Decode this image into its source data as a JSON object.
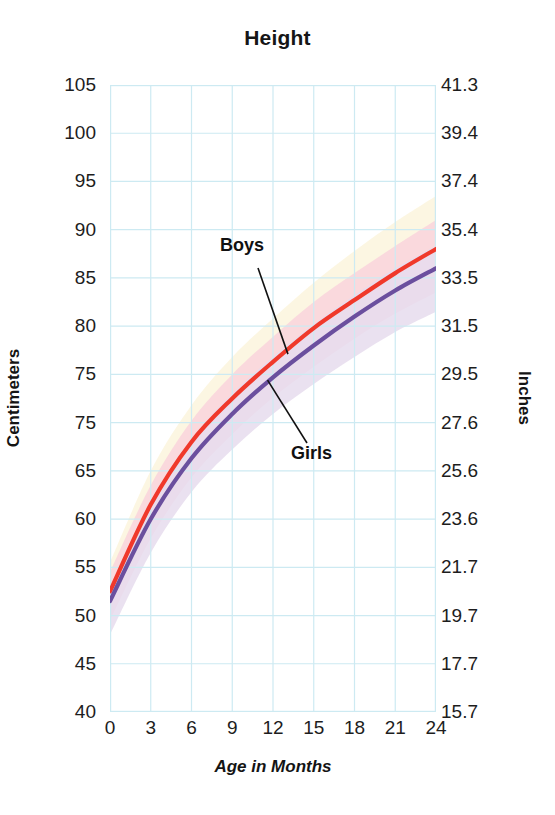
{
  "chart": {
    "title": "Height",
    "xlabel": "Age in Months",
    "ylabel": "Centimeters",
    "y2label": "Inches"
  },
  "annotations": {
    "boys": "Boys",
    "girls": "Girls"
  },
  "colors": {
    "boys_line": "#f0392b",
    "girls_line": "#6b4f9e",
    "grid": "#cdeaf2",
    "band_upper": "#fbf4dd",
    "band_boys": "#f9d3dc",
    "band_girls": "#e6dced",
    "background": "#ffffff"
  },
  "chart_data": {
    "type": "line",
    "title": "Height",
    "xlabel": "Age in Months",
    "ylabel": "Centimeters",
    "y2label": "Inches",
    "grid": true,
    "legend": "inline-annotations",
    "xlim": [
      0,
      24
    ],
    "ylim": [
      40,
      105
    ],
    "x": [
      0,
      3,
      6,
      9,
      12,
      15,
      18,
      21,
      24
    ],
    "xticks": [
      "0",
      "3",
      "6",
      "9",
      "12",
      "15",
      "18",
      "21",
      "24"
    ],
    "yticks": [
      "105",
      "100",
      "95",
      "90",
      "85",
      "80",
      "75",
      "75",
      "65",
      "60",
      "55",
      "50",
      "45",
      "40"
    ],
    "yticks_values": [
      105,
      100,
      95,
      90,
      85,
      80,
      75,
      70,
      65,
      60,
      55,
      50,
      45,
      40
    ],
    "y2ticks": [
      "41.3",
      "39.4",
      "37.4",
      "35.4",
      "33.5",
      "31.5",
      "29.5",
      "27.6",
      "25.6",
      "23.6",
      "21.7",
      "19.7",
      "17.7",
      "15.7"
    ],
    "series": [
      {
        "name": "Boys",
        "color": "#f0392b",
        "values": [
          52.5,
          61.5,
          68.0,
          72.5,
          76.3,
          79.8,
          82.7,
          85.5,
          88.0
        ]
      },
      {
        "name": "Girls",
        "color": "#6b4f9e",
        "values": [
          51.5,
          60.0,
          66.3,
          70.9,
          74.7,
          78.0,
          81.0,
          83.7,
          86.0
        ]
      }
    ],
    "bands": [
      {
        "name": "upper-range-band",
        "color": "#fbf4dd",
        "upper": [
          55.5,
          65.0,
          71.8,
          76.8,
          80.8,
          84.5,
          87.8,
          90.8,
          93.5
        ],
        "lower": [
          52.5,
          61.5,
          68.0,
          72.5,
          76.3,
          79.8,
          82.7,
          85.5,
          88.0
        ]
      },
      {
        "name": "boys-range-band",
        "color": "#f9d3dc",
        "upper": [
          54.5,
          63.5,
          70.2,
          75.0,
          78.9,
          82.5,
          85.5,
          88.3,
          91.0
        ],
        "lower": [
          49.5,
          58.0,
          64.3,
          68.8,
          72.6,
          75.8,
          78.7,
          81.3,
          83.5
        ]
      },
      {
        "name": "girls-range-band",
        "color": "#e6dced",
        "upper": [
          53.0,
          61.8,
          68.3,
          73.0,
          76.8,
          80.2,
          83.2,
          86.0,
          88.3
        ],
        "lower": [
          48.0,
          56.5,
          62.8,
          67.2,
          70.9,
          74.0,
          76.8,
          79.4,
          81.5
        ]
      }
    ]
  }
}
